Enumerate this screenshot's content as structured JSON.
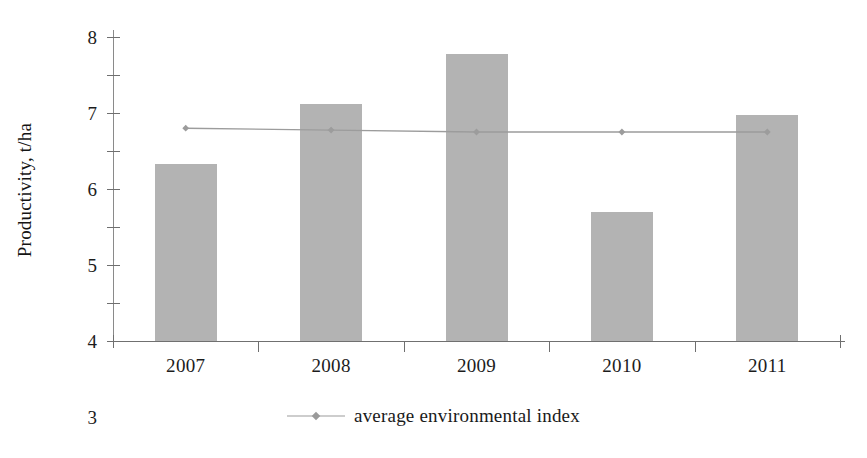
{
  "chart_data": {
    "type": "bar",
    "title": "",
    "xlabel": "",
    "ylabel": "Productivity, t/ha",
    "categories": [
      "2007",
      "2008",
      "2009",
      "2010",
      "2011"
    ],
    "ylim": [
      0,
      8
    ],
    "ytick_step": 1,
    "yticks": [
      "8",
      "7",
      "6",
      "5",
      "4",
      "3",
      "2",
      "1",
      "0"
    ],
    "grid": false,
    "legend_position": "bottom-center",
    "series": [
      {
        "name": "productivity",
        "type": "bar",
        "color": "#b3b3b3",
        "show_in_legend": false,
        "values": [
          4.65,
          6.25,
          7.55,
          3.4,
          5.95
        ]
      },
      {
        "name": "average environmental index",
        "type": "line",
        "color": "#9c9c9c",
        "marker": "diamond",
        "show_in_legend": true,
        "values": [
          5.6,
          5.55,
          5.5,
          5.5,
          5.5
        ]
      }
    ]
  },
  "axis": {
    "y_title": "Productivity, t/ha"
  },
  "legend": {
    "items": [
      {
        "label": "average environmental index"
      }
    ]
  }
}
